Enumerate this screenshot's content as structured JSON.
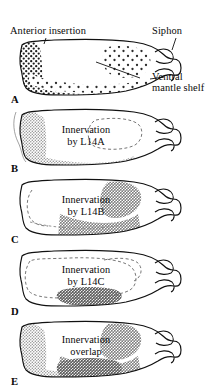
{
  "figure": {
    "title_alt": "Mantle organ innervation fields of neurons L14A, L14B and L14C",
    "background": "#ffffff",
    "ink": "#111111"
  },
  "callouts": [
    {
      "id": "anterior",
      "text": "Anterior insertion"
    },
    {
      "id": "siphon",
      "text": "Siphon"
    }
  ],
  "callout_ventral": {
    "line1": "Ventral",
    "line2": "mantle shelf"
  },
  "panels": [
    {
      "letter": "A",
      "caption_line1": "",
      "caption_line2": "",
      "shading": "dense-stipple",
      "shading_color": "#2a2a2a",
      "description": "anatomy panel with dense stipple"
    },
    {
      "letter": "B",
      "caption_line1": "Innervation",
      "caption_line2": "by L14A",
      "shading": "light-stipple",
      "shading_color": "#b9b9b9",
      "description": "L14A field on anterior insertion and ventral mantle shelf"
    },
    {
      "letter": "C",
      "caption_line1": "Innervation",
      "caption_line2": "by L14B",
      "shading": "mid-stipple",
      "shading_color": "#a8a8a8",
      "description": "L14B field on posterior ventral mantle shelf"
    },
    {
      "letter": "D",
      "caption_line1": "Innervation",
      "caption_line2": "by L14C",
      "shading": "dark-patch",
      "shading_color": "#9a9a9a",
      "description": "L14C field restricted to a small ventral patch"
    },
    {
      "letter": "E",
      "caption_line1": "Innervation",
      "caption_line2": "overlap",
      "shading": "overlap",
      "shading_color": "#9e9e9e",
      "description": "composite overlap of L14A, L14B and L14C fields"
    }
  ]
}
